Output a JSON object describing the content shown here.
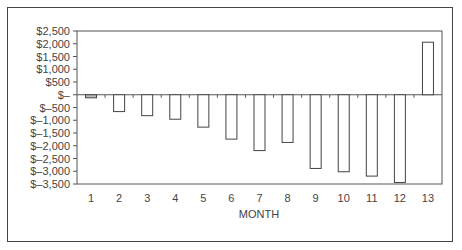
{
  "chart_data": {
    "type": "bar",
    "title": "",
    "xlabel": "MONTH",
    "ylabel": "",
    "categories": [
      "1",
      "2",
      "3",
      "4",
      "5",
      "6",
      "7",
      "8",
      "9",
      "10",
      "11",
      "12",
      "13"
    ],
    "values": [
      -120,
      -660,
      -820,
      -960,
      -1270,
      -1740,
      -2190,
      -1870,
      -2890,
      -3020,
      -3190,
      -3440,
      2060
    ],
    "ylim": [
      -3500,
      2500
    ],
    "yticks": [
      2500,
      2000,
      1500,
      1000,
      500,
      0,
      -500,
      -1000,
      -1500,
      -2000,
      -2500,
      -3000,
      -3500
    ],
    "ytick_labels": [
      "$2,500",
      "$2,000",
      "$1,500",
      "$1,000",
      "$500",
      "$–",
      "$–500",
      "$–1,000",
      "$–1,500",
      "$–2,000",
      "$–2,500",
      "$–3,000",
      "$–3,500"
    ],
    "grid": false,
    "legend": null,
    "bar_fill": "#ffffff",
    "bar_stroke": "#444444"
  }
}
